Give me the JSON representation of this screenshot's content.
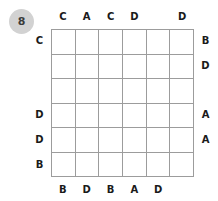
{
  "puzzle": {
    "number": "8",
    "grid": {
      "rows": 6,
      "columns": 6,
      "line_color": "#9c9c9c",
      "cell_color": "#ffffff"
    },
    "badge": {
      "background_color": "#d2d2d2",
      "text_color": "#3a3a3a"
    },
    "clues": {
      "top": [
        "C",
        "A",
        "C",
        "D",
        "",
        "D"
      ],
      "bottom": [
        "B",
        "D",
        "B",
        "A",
        "D",
        ""
      ],
      "left": [
        "C",
        "",
        "",
        "D",
        "D",
        "B"
      ],
      "right": [
        "B",
        "D",
        "",
        "A",
        "A",
        ""
      ]
    }
  }
}
